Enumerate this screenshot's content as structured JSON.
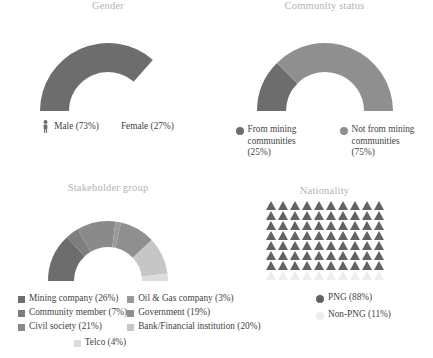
{
  "colors": {
    "title": "#b3b3b3",
    "text": "#3f3f3f",
    "dark_gray": "#6d6d6d",
    "mid_gray": "#7e7e7e",
    "light_gray": "#9a9a9a",
    "lighter_gray": "#b9b9b9",
    "lightest_gray": "#d4d4d4",
    "empty": "#ffffff",
    "background": "#ffffff"
  },
  "panels": {
    "gender": {
      "title": "Gender",
      "legend": [
        {
          "label": "Male (73%)",
          "icon": "person-icon",
          "color": "#6d6d6d"
        },
        {
          "label": "Female (27%)",
          "icon": "none",
          "color": "#ffffff"
        }
      ]
    },
    "community": {
      "title": "Community status",
      "legend": [
        {
          "label": "From mining communities (25%)",
          "icon": "dot",
          "color": "#6d6d6d"
        },
        {
          "label": "Not from mining communities (75%)",
          "icon": "dot",
          "color": "#8f8f8f"
        }
      ]
    },
    "stakeholder": {
      "title": "Stakeholder group",
      "legend_left": [
        {
          "label": "Mining company (26%)",
          "color": "#6d6d6d"
        },
        {
          "label": "Community member (7%)",
          "color": "#7e7e7e"
        },
        {
          "label": "Civil society (21%)",
          "color": "#8a8a8a"
        }
      ],
      "legend_right": [
        {
          "label": "Oil & Gas company (3%)",
          "color": "#9a9a9a"
        },
        {
          "label": "Government (19%)",
          "color": "#8f8f8f"
        },
        {
          "label": "Bank/Financial institution (20%)",
          "color": "#c6c6c6"
        }
      ],
      "legend_bottom": [
        {
          "label": "Telco (4%)",
          "color": "#dcdcdc"
        }
      ]
    },
    "nationality": {
      "title": "Nationality",
      "legend": [
        {
          "label": "PNG (88%)",
          "icon": "dot",
          "color": "#636363"
        },
        {
          "label": "Non-PNG (11%)",
          "icon": "dot",
          "color": "#ededed"
        }
      ]
    }
  },
  "chart_data": [
    {
      "id": "gender",
      "type": "pie",
      "title": "Gender",
      "variant": "half-donut",
      "categories": [
        "Male",
        "Female"
      ],
      "values": [
        73,
        27
      ],
      "unit": "%",
      "colors": [
        "#6d6d6d",
        "#ffffff"
      ],
      "legend": [
        "Male (73%)",
        "Female (27%)"
      ],
      "legend_position": "bottom",
      "notes": "Semi-circular donut spanning 180 degrees; Female slice rendered blank/white"
    },
    {
      "id": "community_status",
      "type": "pie",
      "title": "Community status",
      "variant": "half-donut",
      "categories": [
        "From mining communities",
        "Not from mining communities"
      ],
      "values": [
        25,
        75
      ],
      "unit": "%",
      "colors": [
        "#6d6d6d",
        "#8f8f8f"
      ],
      "legend": [
        "From mining communities (25%)",
        "Not from mining communities (75%)"
      ],
      "legend_position": "bottom"
    },
    {
      "id": "stakeholder_group",
      "type": "pie",
      "title": "Stakeholder group",
      "variant": "half-donut",
      "categories": [
        "Mining company",
        "Community member",
        "Civil society",
        "Oil & Gas company",
        "Government",
        "Bank/Financial institution",
        "Telco"
      ],
      "values": [
        26,
        7,
        21,
        3,
        19,
        20,
        4
      ],
      "unit": "%",
      "colors": [
        "#6d6d6d",
        "#7e7e7e",
        "#8a8a8a",
        "#9a9a9a",
        "#8f8f8f",
        "#c6c6c6",
        "#dcdcdc"
      ],
      "legend": [
        "Mining company (26%)",
        "Community member (7%)",
        "Civil society (21%)",
        "Oil & Gas company (3%)",
        "Government (19%)",
        "Bank/Financial institution (20%)",
        "Telco (4%)"
      ],
      "legend_position": "bottom"
    },
    {
      "id": "nationality",
      "type": "pie",
      "title": "Nationality",
      "variant": "pictogram",
      "categories": [
        "PNG",
        "Non-PNG"
      ],
      "values": [
        88,
        11
      ],
      "unit": "%",
      "colors": [
        "#636363",
        "#ededed"
      ],
      "legend": [
        "PNG (88%)",
        "Non-PNG (11%)"
      ],
      "legend_position": "bottom",
      "pictogram": {
        "glyph": "triangle",
        "columns": 10,
        "rows": 8,
        "total_icons": 80,
        "filled_icons": 70,
        "icon_value_percent": 1.25
      }
    }
  ],
  "donut_geometry": {
    "gender": [
      {
        "name": "Male",
        "start_deg": 180,
        "sweep_deg": 131.4,
        "color": "#6d6d6d"
      },
      {
        "name": "Female",
        "start_deg": 311.4,
        "sweep_deg": 48.6,
        "color": "#ffffff"
      }
    ],
    "community": [
      {
        "name": "From mining communities",
        "start_deg": 180,
        "sweep_deg": 45,
        "color": "#6d6d6d"
      },
      {
        "name": "Not from mining communities",
        "start_deg": 225,
        "sweep_deg": 135,
        "color": "#8f8f8f"
      }
    ],
    "stakeholder": [
      {
        "name": "Mining company",
        "start_deg": 180,
        "sweep_deg": 46.8,
        "color": "#6d6d6d"
      },
      {
        "name": "Community member",
        "start_deg": 226.8,
        "sweep_deg": 12.6,
        "color": "#7e7e7e"
      },
      {
        "name": "Civil society",
        "start_deg": 239.4,
        "sweep_deg": 37.8,
        "color": "#8a8a8a"
      },
      {
        "name": "Oil & Gas company",
        "start_deg": 277.2,
        "sweep_deg": 5.4,
        "color": "#9a9a9a"
      },
      {
        "name": "Government",
        "start_deg": 282.6,
        "sweep_deg": 34.2,
        "color": "#8f8f8f"
      },
      {
        "name": "Bank/Financial institution",
        "start_deg": 316.8,
        "sweep_deg": 36,
        "color": "#c6c6c6"
      },
      {
        "name": "Telco",
        "start_deg": 352.8,
        "sweep_deg": 7.2,
        "color": "#dcdcdc"
      }
    ]
  }
}
